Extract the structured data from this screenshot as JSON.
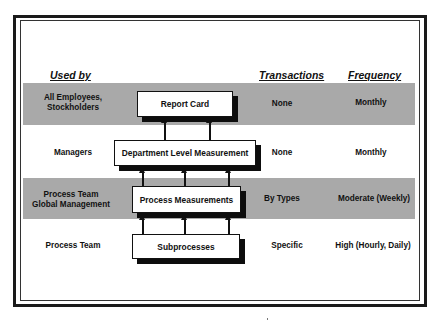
{
  "headers": {
    "used_by": "Used by",
    "transactions": "Transactions",
    "frequency": "Frequency"
  },
  "rows": [
    {
      "used_by_line1": "All Employees,",
      "used_by_line2": "Stockholders",
      "box": "Report Card",
      "transactions": "None",
      "frequency": "Monthly",
      "shaded": true
    },
    {
      "used_by_line1": "Managers",
      "used_by_line2": "",
      "box": "Department Level Measurement",
      "transactions": "None",
      "frequency": "Monthly",
      "shaded": false
    },
    {
      "used_by_line1": "Process Team",
      "used_by_line2": "Global Management",
      "box": "Process Measurements",
      "transactions": "By Types",
      "frequency": "Moderate (Weekly)",
      "shaded": true
    },
    {
      "used_by_line1": "Process Team",
      "used_by_line2": "",
      "box": "Subprocesses",
      "transactions": "Specific",
      "frequency": "High (Hourly, Daily)",
      "shaded": false
    }
  ],
  "colors": {
    "band": "#a9a9a9",
    "border": "#1a1a1a",
    "box_fill": "#ffffff",
    "shadow": "#0d0d0d"
  }
}
